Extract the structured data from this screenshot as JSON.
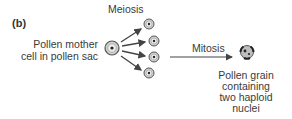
{
  "panel_label": "(b)",
  "labels": {
    "meiosis": "Meiosis",
    "mitosis": "Mitosis",
    "mother_cell_line1": "Pollen mother",
    "mother_cell_line2": "cell in pollen sac",
    "grain_line1": "Pollen grain",
    "grain_line2": "containing",
    "grain_line3": "two haploid",
    "grain_line4": "nuclei"
  },
  "colors": {
    "cell_fill": "#cfcfcf",
    "cell_stroke": "#555555",
    "arrow": "#444444",
    "text": "#3a3a3a"
  }
}
